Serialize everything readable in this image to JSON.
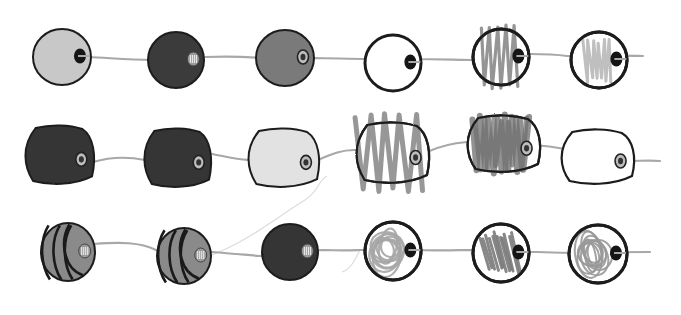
{
  "illustration": {
    "description": "Three rows of hand-drawn beads strung on thin grey strings",
    "background": "#ffffff",
    "string_color": "#a8a8a8",
    "outline_color": "#1e1e1e",
    "rows": [
      {
        "id": "row-1-round",
        "string": "M 88 57 C 110 58, 130 60, 152 60 C 175 60, 190 57, 205 57 C 230 56, 250 57, 262 58 C 290 58, 300 59, 313 58 C 330 58, 350 59, 366 59 C 390 58, 400 58, 412 59 C 440 59, 460 60, 476 60 C 500 55, 520 54, 530 54 C 545 54, 560 55, 567 56 C 600 56, 620 55, 643 56",
        "beads": [
          {
            "shape": "round",
            "cx": 62,
            "cy": 57,
            "rx": 29,
            "ry": 28,
            "fill": "#c8c8c8",
            "pattern": "solid",
            "hole": "dark"
          },
          {
            "shape": "round",
            "cx": 176,
            "cy": 60,
            "rx": 28,
            "ry": 28,
            "fill": "#3a3a3a",
            "pattern": "solid",
            "hole": "threaded"
          },
          {
            "shape": "round",
            "cx": 285,
            "cy": 58,
            "rx": 29,
            "ry": 28,
            "fill": "#7a7a7a",
            "pattern": "solid",
            "hole": "ring"
          },
          {
            "shape": "round",
            "cx": 393,
            "cy": 63,
            "rx": 28,
            "ry": 28,
            "fill": "#ffffff",
            "pattern": "none",
            "hole": "dark"
          },
          {
            "shape": "round",
            "cx": 501,
            "cy": 57,
            "rx": 28,
            "ry": 28,
            "fill": "#ffffff",
            "pattern": "zigzag-dark",
            "hole": "dark"
          },
          {
            "shape": "round",
            "cx": 599,
            "cy": 60,
            "rx": 28,
            "ry": 28,
            "fill": "#ffffff",
            "pattern": "zigzag-light",
            "hole": "dark"
          }
        ]
      },
      {
        "id": "row-2-barrel",
        "string": "M 93 162 C 110 157, 125 156, 145 160 C 170 158, 195 150, 208 153 C 230 158, 245 160, 250 160 C 280 160, 300 158, 318 160 C 330 155, 340 150, 354 150 C 380 150, 415 150, 427 152 C 440 146, 455 143, 467 142 C 500 143, 530 145, 533 145 C 550 146, 560 148, 565 149 C 600 150, 620 160, 626 161 C 640 161, 650 160, 660 161",
        "beads": [
          {
            "shape": "barrel",
            "cx": 59,
            "cy": 155,
            "rx": 36,
            "ry": 29,
            "fill": "#353535",
            "pattern": "solid",
            "hole": "ring"
          },
          {
            "shape": "barrel",
            "cx": 177,
            "cy": 158,
            "rx": 35,
            "ry": 29,
            "fill": "#353535",
            "pattern": "solid",
            "hole": "ring"
          },
          {
            "shape": "barrel",
            "cx": 283,
            "cy": 158,
            "rx": 37,
            "ry": 29,
            "fill": "#e2e2e2",
            "pattern": "solid",
            "hole": "ring"
          },
          {
            "shape": "barrel",
            "cx": 392,
            "cy": 153,
            "rx": 38,
            "ry": 30,
            "fill": "#ffffff",
            "pattern": "zigzag-wide",
            "hole": "ring"
          },
          {
            "shape": "barrel",
            "cx": 503,
            "cy": 144,
            "rx": 38,
            "ry": 28,
            "fill": "#ffffff",
            "pattern": "scribble-dense",
            "hole": "ring"
          },
          {
            "shape": "barrel",
            "cx": 597,
            "cy": 157,
            "rx": 38,
            "ry": 27,
            "fill": "#ffffff",
            "pattern": "none",
            "hole": "ring"
          }
        ]
      },
      {
        "id": "row-3-mixed",
        "string": "M 94 244 C 120 242, 140 242, 156 250 C 180 252, 200 253, 212 252 C 240 254, 255 256, 262 256 C 290 252, 300 250, 325 250 C 345 251, 358 250, 362 250 C 390 250, 400 250, 420 250 C 440 251, 460 250, 473 250 C 500 251, 520 252, 537 252 C 560 253, 570 253, 585 253 C 610 252, 630 252, 650 252",
        "beads": [
          {
            "shape": "striped",
            "cx": 68,
            "cy": 252,
            "rx": 27,
            "ry": 29,
            "fill": "#8a8a8a",
            "pattern": "stripes",
            "hole": "threaded"
          },
          {
            "shape": "striped",
            "cx": 184,
            "cy": 256,
            "rx": 27,
            "ry": 28,
            "fill": "#8a8a8a",
            "pattern": "stripes",
            "hole": "threaded"
          },
          {
            "shape": "round",
            "cx": 290,
            "cy": 252,
            "rx": 28,
            "ry": 28,
            "fill": "#353535",
            "pattern": "solid",
            "hole": "threaded"
          },
          {
            "shape": "round",
            "cx": 393,
            "cy": 251,
            "rx": 28,
            "ry": 29,
            "fill": "#ffffff",
            "pattern": "spiral-light",
            "hole": "dark"
          },
          {
            "shape": "round",
            "cx": 501,
            "cy": 253,
            "rx": 28,
            "ry": 29,
            "fill": "#ffffff",
            "pattern": "hatch-dark",
            "hole": "dark"
          },
          {
            "shape": "round",
            "cx": 598,
            "cy": 254,
            "rx": 29,
            "ry": 29,
            "fill": "#ffffff",
            "pattern": "spiral-loops",
            "hole": "dark"
          }
        ]
      }
    ],
    "stray_strings": [
      "M 212 255 C 250 240, 280 215, 305 200 C 320 190, 318 180, 327 176",
      "M 342 272 C 350 270, 355 260, 360 250"
    ]
  }
}
